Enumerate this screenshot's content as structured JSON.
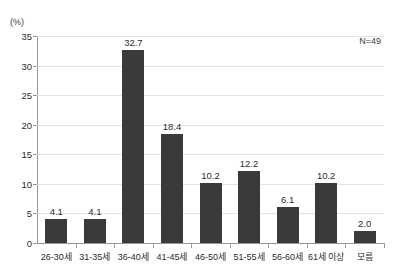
{
  "chart_data": {
    "type": "bar",
    "title": "",
    "subtitle": "",
    "unit_label": "(%)",
    "annotation": "N=49",
    "xlabel": "",
    "ylabel": "",
    "ylim": [
      0,
      35
    ],
    "ytick_step": 5,
    "yticks": [
      0,
      5,
      10,
      15,
      20,
      25,
      30,
      35
    ],
    "ytick_labels": [
      "0",
      "5",
      "10",
      "15",
      "20",
      "25",
      "30",
      "35"
    ],
    "categories": [
      "26-30세",
      "31-35세",
      "36-40세",
      "41-45세",
      "46-50세",
      "51-55세",
      "56-60세",
      "61세 이상",
      "모름"
    ],
    "values": [
      4.1,
      4.1,
      32.7,
      18.4,
      10.2,
      12.2,
      6.1,
      10.2,
      2.0
    ],
    "value_labels": [
      "4.1",
      "4.1",
      "32.7",
      "18.4",
      "10.2",
      "12.2",
      "6.1",
      "10.2",
      "2.0"
    ],
    "grid": true,
    "legend": "none",
    "bar_color": "#3a3a3a",
    "gridline_color": "#e2e2e2",
    "axis_color": "#9a9a9a",
    "background_color": "#ffffff"
  }
}
